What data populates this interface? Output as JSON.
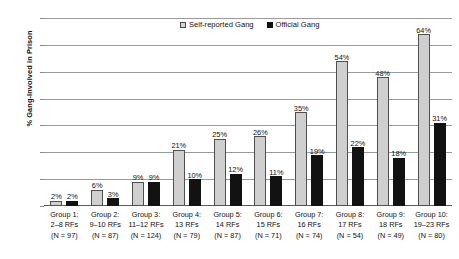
{
  "chart_data": {
    "type": "bar",
    "title": "",
    "xlabel": "",
    "ylabel": "% Gang-Involved in Prison",
    "ylim": [
      0,
      70
    ],
    "ytick_labels": [
      "70%",
      "60%",
      "50%",
      "40%",
      "30%",
      "20%",
      "10%",
      "0%"
    ],
    "ytick_values": [
      70,
      60,
      50,
      40,
      30,
      20,
      10,
      0
    ],
    "grid": true,
    "legend_position": "top-center",
    "categories": [
      "Group 1:\n2–8 RFs\n(N = 97)",
      "Group 2:\n9–10 RFs\n(N = 87)",
      "Group 3:\n11–12 RFs\n(N = 124)",
      "Group 4:\n13 RFs\n(N = 79)",
      "Group 5:\n14 RFs\n(N = 87)",
      "Group 6:\n15 RFs\n(N = 71)",
      "Group 7:\n16 RFs\n(N = 74)",
      "Group 8:\n17 RFs\n(N = 54)",
      "Group 9:\n18 RFs\n(N = 49)",
      "Group 10:\n19–23 RFs\n(N = 80)"
    ],
    "series": [
      {
        "name": "Self-reported Gang",
        "color": "#cfcfcf",
        "values": [
          2,
          6,
          9,
          21,
          25,
          26,
          35,
          54,
          48,
          64
        ],
        "data_labels": [
          "2%",
          "6%",
          "9%",
          "21%",
          "25%",
          "26%",
          "35%",
          "54%",
          "48%",
          "64%"
        ]
      },
      {
        "name": "Official Gang",
        "color": "#121212",
        "values": [
          2,
          3,
          9,
          10,
          12,
          11,
          19,
          22,
          18,
          31
        ],
        "data_labels": [
          "2%",
          "3%",
          "9%",
          "10%",
          "12%",
          "11%",
          "19%",
          "22%",
          "18%",
          "31%"
        ]
      }
    ]
  },
  "legend": {
    "items": [
      {
        "label": "Self-reported Gang",
        "style": "light"
      },
      {
        "label": "Official Gang",
        "style": "dark"
      }
    ]
  },
  "x_axis_groups": [
    {
      "line1": "Group 1:",
      "line2": "2–8 RFs",
      "line3": "(N = 97)"
    },
    {
      "line1": "Group 2:",
      "line2": "9–10 RFs",
      "line3": "(N = 87)"
    },
    {
      "line1": "Group 3:",
      "line2": "11–12 RFs",
      "line3": "(N = 124)"
    },
    {
      "line1": "Group 4:",
      "line2": "13 RFs",
      "line3": "(N = 79)"
    },
    {
      "line1": "Group 5:",
      "line2": "14 RFs",
      "line3": "(N = 87)"
    },
    {
      "line1": "Group 6:",
      "line2": "15 RFs",
      "line3": "(N = 71)"
    },
    {
      "line1": "Group 7:",
      "line2": "16 RFs",
      "line3": "(N = 74)"
    },
    {
      "line1": "Group 8:",
      "line2": "17 RFs",
      "line3": "(N = 54)"
    },
    {
      "line1": "Group 9:",
      "line2": "18 RFs",
      "line3": "(N = 49)"
    },
    {
      "line1": "Group 10:",
      "line2": "19–23 RFs",
      "line3": "(N = 80)"
    }
  ],
  "colors": {
    "self_reported_fill": "#cfcfcf",
    "self_reported_border": "#4f4f4f",
    "official_fill": "#121212",
    "gridline": "#9a9a9a",
    "text": "#111111",
    "background": "#ffffff"
  }
}
